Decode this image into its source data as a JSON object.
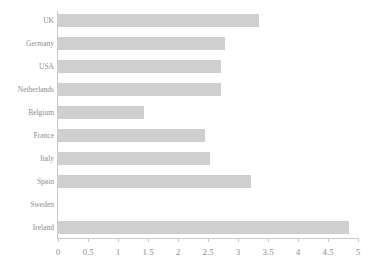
{
  "chart_data": {
    "type": "bar",
    "orientation": "horizontal",
    "title": "",
    "xlabel": "",
    "ylabel": "",
    "categories": [
      "UK",
      "Germany",
      "USA",
      "Netherlands",
      "Belgium",
      "France",
      "Italy",
      "Spain",
      "Sweden",
      "Ireland"
    ],
    "values": [
      3.35,
      2.78,
      2.72,
      2.72,
      1.43,
      2.45,
      2.53,
      3.22,
      0.0,
      4.85
    ],
    "xlim": [
      0,
      5
    ],
    "xticks": [
      "0",
      "0.5",
      "1",
      "1.5",
      "2",
      "2.5",
      "3",
      "3.5",
      "4",
      "4.5",
      "5"
    ],
    "xtick_values": [
      0,
      0.5,
      1,
      1.5,
      2,
      2.5,
      3,
      3.5,
      4,
      4.5,
      5
    ],
    "grid": false,
    "legend": false,
    "bar_color": "#cfcfcf",
    "axis_color": "#c9c9c9",
    "text_color": "#8e8e8e"
  }
}
